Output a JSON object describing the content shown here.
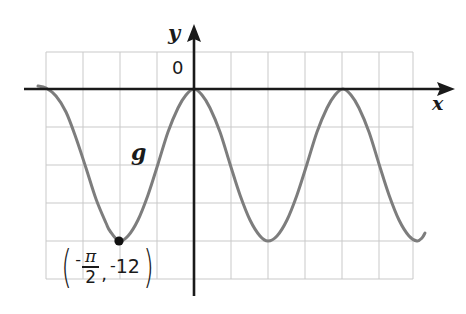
{
  "figure": {
    "type": "coordinate-plane-graph",
    "background_color": "#ffffff"
  },
  "axes": {
    "y_label": "y",
    "x_label": "x",
    "origin_label": "0",
    "axis_color": "#1a1a1a",
    "grid_color": "#c9c9c9",
    "x_axis_y_px": 89,
    "y_axis_x_px": 194,
    "grid_left_px": 46,
    "grid_right_px": 413,
    "grid_top_px": 52,
    "grid_bottom_px": 279,
    "grid_spacing_px": 38
  },
  "curve": {
    "name": "g",
    "label": "g",
    "color": "#7d7d7d",
    "stroke_width": 3
  },
  "annotation": {
    "point_label_open_paren": "(",
    "point_label_close_paren": ")",
    "x_negative_sign": "-",
    "x_numerator": "π",
    "x_denominator": "2",
    "comma": ",",
    "y_minus": "-",
    "y_value": "12",
    "point_dot_color": "#111111"
  },
  "chart_data": {
    "type": "line",
    "title": "",
    "xlabel": "x",
    "ylabel": "y",
    "grid": true,
    "legend": false,
    "annotations": [
      {
        "text": "(-π/2, -12)",
        "point_x": -1.5707963,
        "point_y": -12,
        "marker": "filled-circle"
      },
      {
        "text": "g",
        "role": "curve-label"
      }
    ],
    "series": [
      {
        "name": "g",
        "color": "#7d7d7d",
        "description": "Cosine-type curve with maximum value 0 and minimum value -12; amplitude 6, midline -6; maxima on the x-axis, minima at y = -12.",
        "amplitude": 6,
        "midline": -6,
        "maximum": 0,
        "minimum": -12,
        "period_px": 149,
        "maxima_x_px": [
          194,
          343
        ],
        "minima_x_px": [
          119,
          268,
          417
        ],
        "zero_touch_points_px": [
          [
            194,
            89
          ],
          [
            343,
            89
          ]
        ],
        "points_px": [
          [
            38,
            86
          ],
          [
            46,
            88
          ],
          [
            56,
            96
          ],
          [
            66,
            112
          ],
          [
            76,
            138
          ],
          [
            86,
            168
          ],
          [
            96,
            199
          ],
          [
            106,
            223
          ],
          [
            110,
            231
          ],
          [
            119,
            241
          ],
          [
            128,
            236
          ],
          [
            138,
            220
          ],
          [
            148,
            195
          ],
          [
            158,
            164
          ],
          [
            168,
            132
          ],
          [
            178,
            108
          ],
          [
            186,
            95
          ],
          [
            194,
            89
          ],
          [
            202,
            95
          ],
          [
            210,
            108
          ],
          [
            220,
            132
          ],
          [
            230,
            164
          ],
          [
            240,
            195
          ],
          [
            250,
            220
          ],
          [
            260,
            236
          ],
          [
            268,
            241
          ],
          [
            277,
            236
          ],
          [
            287,
            220
          ],
          [
            297,
            195
          ],
          [
            307,
            164
          ],
          [
            317,
            132
          ],
          [
            327,
            108
          ],
          [
            335,
            95
          ],
          [
            343,
            89
          ],
          [
            351,
            95
          ],
          [
            359,
            108
          ],
          [
            369,
            132
          ],
          [
            379,
            164
          ],
          [
            389,
            195
          ],
          [
            399,
            220
          ],
          [
            409,
            236
          ],
          [
            417,
            241
          ],
          [
            422,
            238
          ],
          [
            425,
            233
          ]
        ]
      }
    ]
  }
}
